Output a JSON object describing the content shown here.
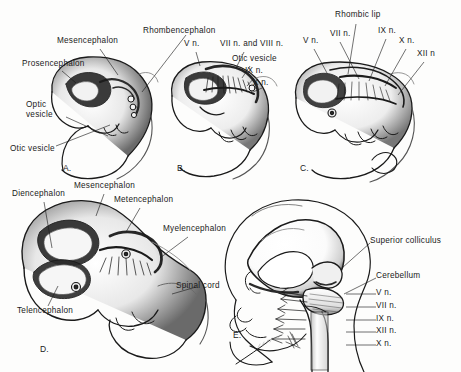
{
  "figure": {
    "background_color": "#fdfdfc",
    "ink_color": "#1a1a1a",
    "signature": "artist-signature"
  },
  "panels": [
    {
      "id": "A",
      "letter": "A.",
      "labels": [
        {
          "name": "mesencephalon",
          "text": "Mesencephalon",
          "x": 57,
          "y": 40
        },
        {
          "name": "prosencephalon",
          "text": "Prosencephalon",
          "x": 27,
          "y": 63
        },
        {
          "name": "optic-vesicle",
          "text": "Optic\nvesicle",
          "x": 30,
          "y": 104
        },
        {
          "name": "otic-vesicle",
          "text": "Otic vesicle",
          "x": 12,
          "y": 148
        },
        {
          "name": "rhombencephalon",
          "text": "Rhombencephalon",
          "x": 145,
          "y": 28
        }
      ]
    },
    {
      "id": "B",
      "letter": "B.",
      "labels": [
        {
          "name": "v-nerve",
          "text": "V n.",
          "x": 186,
          "y": 43
        },
        {
          "name": "vii-viii-nerve",
          "text": "VII n. and VIII n.",
          "x": 222,
          "y": 43
        },
        {
          "name": "otic-vesicle",
          "text": "Otic vesicle",
          "x": 234,
          "y": 58
        },
        {
          "name": "ix-nerve",
          "text": "IX n.",
          "x": 247,
          "y": 70
        },
        {
          "name": "x-nerve",
          "text": "X n.",
          "x": 255,
          "y": 82
        }
      ]
    },
    {
      "id": "C",
      "letter": "C.",
      "labels": [
        {
          "name": "rhombic-lip",
          "text": "Rhombic lip",
          "x": 337,
          "y": 14
        },
        {
          "name": "v-nerve",
          "text": "V n.",
          "x": 307,
          "y": 40
        },
        {
          "name": "vii-nerve",
          "text": "VII n.",
          "x": 333,
          "y": 33
        },
        {
          "name": "ix-nerve",
          "text": "IX n.",
          "x": 380,
          "y": 30
        },
        {
          "name": "x-nerve",
          "text": "X n.",
          "x": 400,
          "y": 40
        },
        {
          "name": "xii-nerve",
          "text": "XII n",
          "x": 418,
          "y": 53
        }
      ]
    },
    {
      "id": "D",
      "letter": "D.",
      "labels": [
        {
          "name": "diencephalon",
          "text": "Diencephalon",
          "x": 14,
          "y": 193
        },
        {
          "name": "mesencephalon",
          "text": "Mesencephalon",
          "x": 77,
          "y": 185
        },
        {
          "name": "metencephalon",
          "text": "Metencephalon",
          "x": 117,
          "y": 199
        },
        {
          "name": "myelencephalon",
          "text": "Myelencephalon",
          "x": 165,
          "y": 228
        },
        {
          "name": "spinal-cord",
          "text": "Spinal cord",
          "x": 178,
          "y": 285
        },
        {
          "name": "telencephalon",
          "text": "Telencephalon",
          "x": 19,
          "y": 310
        }
      ]
    },
    {
      "id": "E",
      "letter": "E.",
      "labels": [
        {
          "name": "superior-colliculus",
          "text": "Superior colliculus",
          "x": 372,
          "y": 240
        },
        {
          "name": "cerebellum",
          "text": "Cerebellum",
          "x": 378,
          "y": 275
        },
        {
          "name": "v-nerve",
          "text": "V n.",
          "x": 378,
          "y": 291
        },
        {
          "name": "vii-nerve",
          "text": "VII n.",
          "x": 378,
          "y": 305
        },
        {
          "name": "ix-nerve",
          "text": "IX n.",
          "x": 378,
          "y": 318
        },
        {
          "name": "xii-nerve",
          "text": "XII n.",
          "x": 378,
          "y": 330
        },
        {
          "name": "x-nerve",
          "text": "X n.",
          "x": 378,
          "y": 343
        }
      ]
    }
  ],
  "panel_letters": [
    {
      "name": "panel-letter-a",
      "text": "A.",
      "x": 63,
      "y": 163
    },
    {
      "name": "panel-letter-b",
      "text": "B.",
      "x": 177,
      "y": 163
    },
    {
      "name": "panel-letter-c",
      "text": "C.",
      "x": 300,
      "y": 163
    },
    {
      "name": "panel-letter-d",
      "text": "D.",
      "x": 40,
      "y": 344
    },
    {
      "name": "panel-letter-e",
      "text": "E.",
      "x": 233,
      "y": 330
    }
  ]
}
